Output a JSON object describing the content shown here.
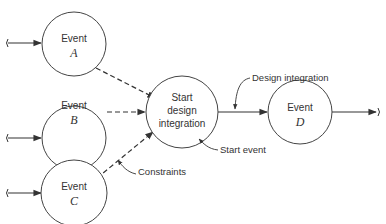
{
  "diagram": {
    "type": "network-event-diagram",
    "nodes": [
      {
        "id": "A",
        "line1": "Event",
        "line2": "A"
      },
      {
        "id": "B",
        "line1": "Event",
        "line2": "B"
      },
      {
        "id": "C",
        "line1": "Event",
        "line2": "C"
      },
      {
        "id": "start",
        "line1": "Start",
        "line2": "design",
        "line3": "integration"
      },
      {
        "id": "D",
        "line1": "Event",
        "line2": "D"
      }
    ],
    "edges": [
      {
        "from": "A",
        "to": "start",
        "style": "dashed"
      },
      {
        "from": "B",
        "to": "start",
        "style": "dashed"
      },
      {
        "from": "C",
        "to": "start",
        "style": "dashed"
      },
      {
        "from": "start",
        "to": "D",
        "style": "solid"
      }
    ],
    "annotations": {
      "design_integration": "Design integration",
      "start_event": "Start event",
      "constraints": "Constraints"
    }
  }
}
